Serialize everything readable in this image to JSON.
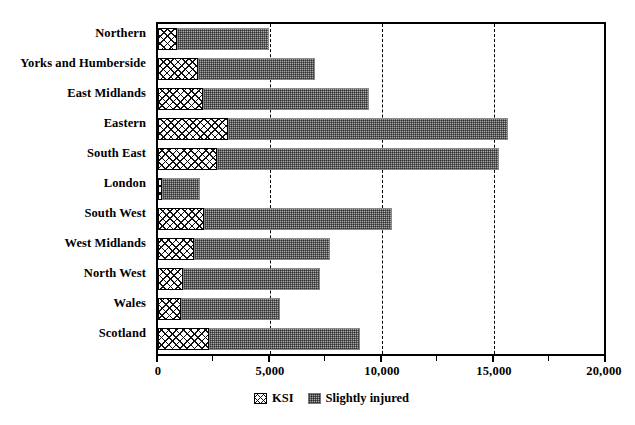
{
  "chart_data": {
    "type": "bar",
    "orientation": "horizontal",
    "stacked": true,
    "title": "",
    "subtitle": "",
    "xlabel": "",
    "ylabel": "",
    "xlim": [
      0,
      20000
    ],
    "xticks": [
      0,
      5000,
      10000,
      15000,
      20000
    ],
    "xtick_labels": [
      "0",
      "5,000",
      "10,000",
      "15,000",
      "20,000"
    ],
    "minor_xticks": [
      2500,
      7500,
      12500,
      17500
    ],
    "grid": "vertical-dashed at 5,000 / 10,000 / 15,000",
    "legend_position": "bottom-center",
    "categories": [
      "Northern",
      "Yorks and Humberside",
      "East Midlands",
      "Eastern",
      "South East",
      "London",
      "South West",
      "West Midlands",
      "North West",
      "Wales",
      "Scotland"
    ],
    "series": [
      {
        "name": "KSI",
        "pattern": "crosshatch",
        "color": "#ffffff",
        "values": [
          850,
          1800,
          2000,
          3150,
          2650,
          200,
          2050,
          1600,
          1100,
          1050,
          2300
        ]
      },
      {
        "name": "Slightly injured",
        "pattern": "stipple",
        "color": "#a9a9a9",
        "values": [
          4150,
          5250,
          7450,
          12550,
          12650,
          1700,
          8450,
          6100,
          6150,
          4400,
          6750
        ]
      }
    ],
    "totals": [
      5000,
      7050,
      9450,
      15700,
      15300,
      1900,
      10500,
      7700,
      7250,
      5450,
      9050
    ]
  },
  "axis": {
    "tick_labels": [
      "0",
      "5,000",
      "10,000",
      "15,000",
      "20,000"
    ]
  },
  "legend": {
    "items": [
      {
        "label": "KSI"
      },
      {
        "label": "Slightly injured"
      }
    ]
  }
}
